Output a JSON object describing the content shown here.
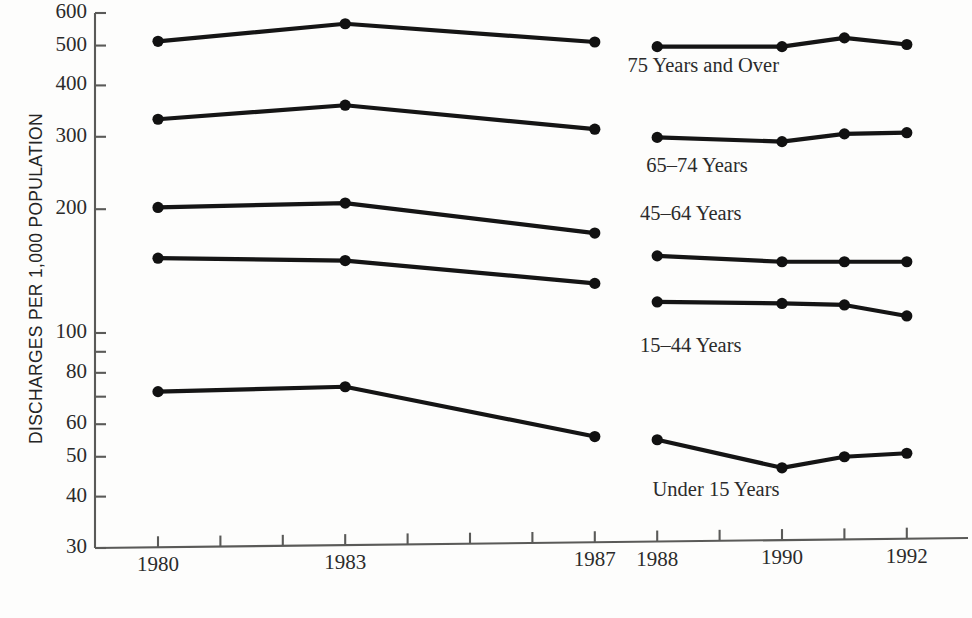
{
  "chart_data": {
    "type": "line",
    "title": "",
    "xlabel": "",
    "ylabel": "DISCHARGES PER 1,000 POPULATION",
    "yscale": "log",
    "ylim": [
      30,
      620
    ],
    "xlim": [
      1979.0,
      1992.6
    ],
    "grid": false,
    "legend_position": "inline-labels",
    "ytick_labels": [
      "600",
      "500",
      "400",
      "300",
      "200",
      "100",
      "80",
      "60",
      "50",
      "40",
      "30"
    ],
    "ytick_values": [
      600,
      500,
      400,
      300,
      200,
      100,
      80,
      60,
      50,
      40,
      30
    ],
    "yminor_values": [
      90,
      70
    ],
    "xtick_labels": [
      "1980",
      "1983",
      "1987",
      "1988",
      "1990",
      "1992"
    ],
    "xtick_values": [
      1980,
      1983,
      1987,
      1988,
      1990,
      1992
    ],
    "xminor_values": [
      1981,
      1982,
      1984,
      1985,
      1986,
      1989,
      1991
    ],
    "series": [
      {
        "name": "75 Years and Over",
        "label": "75 Years and Over",
        "segments": [
          {
            "x": [
              1980,
              1983,
              1987
            ],
            "y": [
              512,
              565,
              510
            ]
          },
          {
            "x": [
              1988,
              1990,
              1991,
              1992
            ],
            "y": [
              497,
              497,
              522,
              503
            ]
          }
        ],
        "label_x": 1989.0,
        "label_y": 440
      },
      {
        "name": "65-74 Years",
        "label": "65–74 Years",
        "segments": [
          {
            "x": [
              1980,
              1983,
              1987
            ],
            "y": [
              331,
              358,
              313
            ]
          },
          {
            "x": [
              1988,
              1990,
              1991,
              1992
            ],
            "y": [
              299,
              292,
              305,
              307
            ]
          }
        ],
        "label_x": 1989.3,
        "label_y": 252
      },
      {
        "name": "45-64 Years",
        "label": "45–64 Years",
        "segments": [
          {
            "x": [
              1980,
              1983,
              1987
            ],
            "y": [
              202,
              207,
              175
            ]
          },
          {
            "x": [
              1988,
              1990,
              1991,
              1992
            ],
            "y": [
              154,
              149,
              149,
              149
            ]
          }
        ],
        "label_x": 1989.2,
        "label_y": 192
      },
      {
        "name": "15-44 Years",
        "label": "15–44 Years",
        "segments": [
          {
            "x": [
              1980,
              1983,
              1987
            ],
            "y": [
              152,
              150,
              132
            ]
          },
          {
            "x": [
              1988,
              1990,
              1991,
              1992
            ],
            "y": [
              119,
              118,
              117,
              110
            ]
          }
        ],
        "label_x": 1989.2,
        "label_y": 92
      },
      {
        "name": "Under 15 Years",
        "label": "Under 15 Years",
        "segments": [
          {
            "x": [
              1980,
              1983,
              1987
            ],
            "y": [
              72,
              74,
              56
            ]
          },
          {
            "x": [
              1988,
              1990,
              1991,
              1992
            ],
            "y": [
              55,
              47,
              50,
              51
            ]
          }
        ],
        "label_x": 1989.4,
        "label_y": 41
      }
    ]
  },
  "figure": {
    "axis_color": "#5a5a58",
    "line_color": "#151515",
    "marker_color": "#111111",
    "text_color": "#2b2b2b",
    "background": "#fdfdfc"
  }
}
